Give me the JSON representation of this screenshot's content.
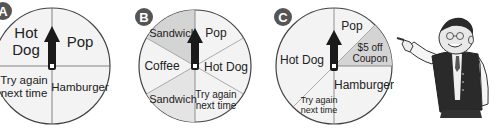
{
  "spinners": [
    {
      "badge": "A",
      "sections": [
        {
          "label_lines": [
            "Hot",
            "Dog"
          ]
        },
        {
          "label_lines": [
            "Pop"
          ]
        },
        {
          "label_lines": [
            "Hamburger"
          ]
        },
        {
          "label_lines": [
            "Try again",
            "next time"
          ]
        }
      ]
    },
    {
      "badge": "B",
      "sections": [
        {
          "label_lines": [
            "Sandwich"
          ]
        },
        {
          "label_lines": [
            "Pop"
          ]
        },
        {
          "label_lines": [
            "Hot Dog"
          ]
        },
        {
          "label_lines": [
            "Try again",
            "next time"
          ]
        },
        {
          "label_lines": [
            "Sandwich"
          ]
        },
        {
          "label_lines": [
            "Coffee"
          ]
        }
      ]
    },
    {
      "badge": "C",
      "sections": [
        {
          "label_lines": [
            "Pop"
          ]
        },
        {
          "label_lines": [
            "$5 off",
            "Coupon"
          ]
        },
        {
          "label_lines": [
            "Hamburger"
          ]
        },
        {
          "label_lines": [
            "Try again",
            "next time"
          ]
        },
        {
          "label_lines": [
            "Hot Dog"
          ]
        }
      ]
    }
  ],
  "illustration": "cartoon-man-pointing",
  "colors": {
    "badge": "#555555",
    "section_light": "#f3f3f3",
    "section_shaded": "#d4d4d4",
    "outline": "#444444",
    "arrow": "#1a1a1a"
  }
}
